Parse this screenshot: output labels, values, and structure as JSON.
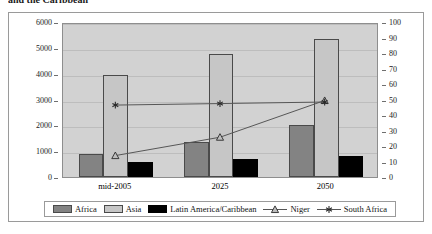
{
  "caption": "and the Caribbean",
  "chart_data": {
    "type": "bar",
    "title": "",
    "xlabel": "",
    "ylabel": "",
    "categories": [
      "mid-2005",
      "2025",
      "2050"
    ],
    "grid": true,
    "legend_position": "bottom",
    "left_axis": {
      "label": "",
      "min": 0,
      "max": 6000,
      "step": 1000,
      "ticks": [
        0,
        1000,
        2000,
        3000,
        4000,
        5000,
        6000
      ]
    },
    "right_axis": {
      "label": "",
      "min": 0,
      "max": 100,
      "step": 10,
      "ticks": [
        0,
        10,
        20,
        30,
        40,
        50,
        60,
        70,
        80,
        90,
        100
      ]
    },
    "series": [
      {
        "name": "Africa",
        "kind": "bar",
        "axis": "left",
        "color": "#838383",
        "values": [
          900,
          1340,
          2000
        ]
      },
      {
        "name": "Asia",
        "kind": "bar",
        "axis": "left",
        "color": "#c6c6c6",
        "values": [
          3930,
          4780,
          5340
        ]
      },
      {
        "name": "Latin America/Caribbean",
        "kind": "bar",
        "axis": "left",
        "color": "#000000",
        "values": [
          570,
          710,
          820
        ]
      },
      {
        "name": "Niger",
        "kind": "line",
        "axis": "right",
        "color": "#555555",
        "marker": "triangle",
        "values": [
          14,
          26,
          50
        ]
      },
      {
        "name": "South Africa",
        "kind": "line",
        "axis": "right",
        "color": "#555555",
        "marker": "asterisk",
        "values": [
          47,
          48,
          49
        ]
      }
    ]
  }
}
